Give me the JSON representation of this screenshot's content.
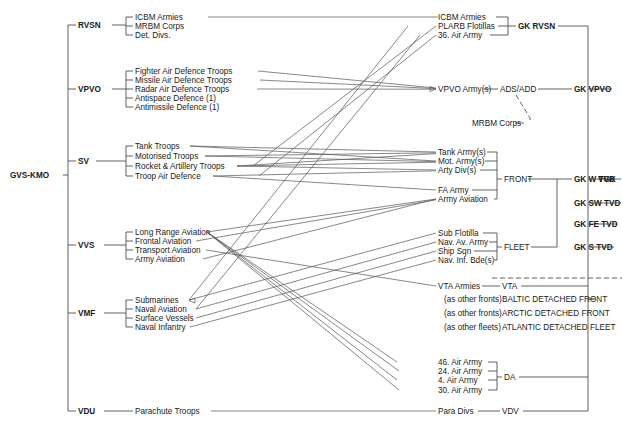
{
  "root": {
    "label": "GVS-KMO"
  },
  "apex": {
    "label": "VGK"
  },
  "services": [
    {
      "key": "rvsn",
      "label": "RVSN",
      "branches": [
        "ICBM Armies",
        "MRBM Corps",
        "Det. Divs."
      ]
    },
    {
      "key": "vpvo",
      "label": "VPVO",
      "branches": [
        "Fighter Air Defence Troops",
        "Missile Air Defence Troops",
        "Radar Air Defence Troops",
        "Antispace Defence (1)",
        "Antimissile Defence (1)"
      ]
    },
    {
      "key": "sv",
      "label": "SV",
      "branches": [
        "Tank Troops",
        "Motorised Troops",
        "Rocket & Artillery Troops",
        "Troop Air Defence"
      ]
    },
    {
      "key": "vvs",
      "label": "VVS",
      "branches": [
        "Long Range Aviation",
        "Frontal Aviation",
        "Transport Aviation",
        "Army Aviation"
      ]
    },
    {
      "key": "vmf",
      "label": "VMF",
      "branches": [
        "Submarines",
        "Naval Aviation",
        "Surface Vessels",
        "Naval Infantry"
      ]
    },
    {
      "key": "vdu",
      "label": "VDU",
      "branches": [
        "Parachute Troops"
      ]
    }
  ],
  "formations": {
    "rvsn_group": [
      "ICBM Armies",
      "PLARB Flotillas",
      "36. Air Army"
    ],
    "vpvo_unit": "VPVO Army(s)",
    "front_group": [
      "Tank Army(s)",
      "Mot. Army(s)",
      "Arty Div(s)",
      "FA Army",
      "Army Aviation"
    ],
    "fleet_group": [
      "Sub Flotilla",
      "Nav. Av. Army",
      "Ship Sqn",
      "Nav. Inf. Bde(s)"
    ],
    "vta_unit": "VTA Armies",
    "da_group": [
      "46. Air Army",
      "24. Air Army",
      "4.   Air Army",
      "30. Air Army"
    ],
    "vdv_unit": "Para Divs",
    "detached_notes": [
      "(as other fronts)",
      "(as other fronts)",
      "(as other fleets)"
    ]
  },
  "commands": {
    "ads_add": "ADS/ADD",
    "mrbm_corps": "MRBM Corps",
    "front": "FRONT",
    "fleet": "FLEET",
    "vta": "VTA",
    "da": "DA",
    "vdv": "VDV",
    "detached": [
      "BALTIC DETACHED FRONT",
      "ARCTIC DETACHED FRONT",
      "ATLANTIC DETACHED FLEET"
    ]
  },
  "high_commands": [
    {
      "label": "GK RVSN"
    },
    {
      "label": "GK VPVO"
    },
    {
      "label": "GK W TVD"
    },
    {
      "label": "GK SW TVD"
    },
    {
      "label": "GK FE TVD"
    },
    {
      "label": "GK S TVD"
    }
  ],
  "colors": {
    "line": "#3a3a3a",
    "text": "#1a1a1a",
    "background": "#ffffff"
  }
}
